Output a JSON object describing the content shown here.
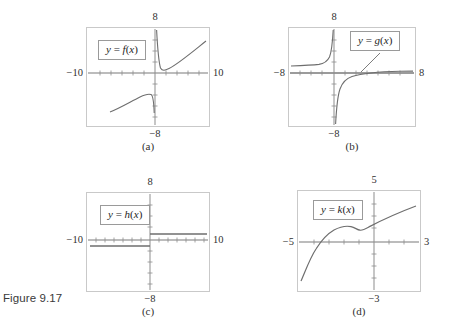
{
  "figure": {
    "caption": "Figure 9.17",
    "background": "#ffffff",
    "frame_color": "#c9c9c9",
    "curve_color": "#6e6e6e",
    "axis_color": "#7a7a7a"
  },
  "panels": [
    {
      "id": "a",
      "subcaption": "(a)",
      "label": "y = f(x)",
      "label_var": "f",
      "axis_labels": {
        "top": "8",
        "bottom": "−8",
        "left": "−10",
        "right": "10"
      },
      "xlim": [
        -10,
        10
      ],
      "ylim": [
        -8,
        8
      ]
    },
    {
      "id": "b",
      "subcaption": "(b)",
      "label": "y = g(x)",
      "label_var": "g",
      "axis_labels": {
        "top": "8",
        "bottom": "−8",
        "left": "−8",
        "right": "8"
      },
      "xlim": [
        -8,
        8
      ],
      "ylim": [
        -8,
        8
      ]
    },
    {
      "id": "c",
      "subcaption": "(c)",
      "label": "y = h(x)",
      "label_var": "h",
      "axis_labels": {
        "top": "8",
        "bottom": "−8",
        "left": "−10",
        "right": "10"
      },
      "xlim": [
        -10,
        10
      ],
      "ylim": [
        -8,
        8
      ]
    },
    {
      "id": "d",
      "subcaption": "(d)",
      "label": "y = k(x)",
      "label_var": "k",
      "axis_labels": {
        "top": "5",
        "bottom": "−3",
        "left": "−5",
        "right": "3"
      },
      "xlim": [
        -5,
        3
      ],
      "ylim": [
        -3,
        5
      ]
    }
  ],
  "chart_data": [
    {
      "type": "line",
      "title": "y = f(x)",
      "xlabel": "",
      "ylabel": "",
      "xlim": [
        -10,
        10
      ],
      "ylim": [
        -8,
        8
      ],
      "grid": false,
      "legend": "none",
      "axis_tick_labels": {
        "top": "8",
        "bottom": "-8",
        "left": "-10",
        "right": "10"
      },
      "vertical_asymptote": 0,
      "series": [
        {
          "name": "f-left-branch",
          "comment": "lower-left arc: rises from lower left, peaks, then plunges to -infinity at x=0-",
          "x": [
            -7.4,
            -6.6,
            -5.8,
            -5.0,
            -4.2,
            -3.4,
            -2.8,
            -2.2,
            -1.7,
            -1.3,
            -1.0,
            -0.8,
            -0.7,
            -0.65,
            -0.6,
            -0.55
          ],
          "y": [
            -6.2,
            -5.8,
            -5.4,
            -5.0,
            -4.6,
            -4.2,
            -3.9,
            -3.6,
            -3.4,
            -3.3,
            -3.3,
            -3.45,
            -3.8,
            -4.3,
            -5.2,
            -6.3
          ]
        },
        {
          "name": "f-right-branch",
          "comment": "descends steeply from +8 near x=0+, minimum just above axis, then rises to upper right",
          "x": [
            0.12,
            0.16,
            0.2,
            0.28,
            0.4,
            0.6,
            0.9,
            1.4,
            2.2,
            3.2,
            4.4,
            5.8,
            7.2,
            8.6,
            9.8
          ],
          "y": [
            8.0,
            6.4,
            4.6,
            2.6,
            1.3,
            0.6,
            0.35,
            0.55,
            1.2,
            2.1,
            3.1,
            4.2,
            5.3,
            6.3,
            7.2
          ]
        }
      ]
    },
    {
      "type": "line",
      "title": "y = g(x)",
      "xlabel": "",
      "ylabel": "",
      "xlim": [
        -8,
        8
      ],
      "ylim": [
        -8,
        8
      ],
      "grid": false,
      "legend": "none",
      "axis_tick_labels": {
        "top": "8",
        "bottom": "-8",
        "left": "-8",
        "right": "8"
      },
      "vertical_asymptote": 0,
      "series": [
        {
          "name": "g-left-branch",
          "comment": "nearly flat slightly above axis from left, then sweeps up to +infinity at x=0-",
          "x": [
            -7.9,
            -7.0,
            -6.0,
            -5.0,
            -4.0,
            -3.2,
            -2.6,
            -2.0,
            -1.6,
            -1.2,
            -0.9,
            -0.65,
            -0.45,
            -0.3,
            -0.2,
            -0.12
          ],
          "y": [
            0.55,
            0.6,
            0.62,
            0.66,
            0.72,
            0.8,
            0.92,
            1.15,
            1.45,
            2.0,
            2.8,
            3.9,
            5.2,
            6.5,
            7.4,
            8.0
          ]
        },
        {
          "name": "g-right-branch",
          "comment": "comes up from -infinity at x=0+, crosses below axis then flattens slightly above axis to the right",
          "x": [
            0.16,
            0.22,
            0.3,
            0.42,
            0.6,
            0.85,
            1.2,
            1.7,
            2.4,
            3.3,
            4.3,
            5.4,
            6.5,
            7.6,
            7.95
          ],
          "y": [
            -8.0,
            -6.6,
            -5.2,
            -3.9,
            -2.8,
            -1.9,
            -1.2,
            -0.7,
            -0.35,
            -0.1,
            0.05,
            0.15,
            0.22,
            0.28,
            0.3
          ]
        }
      ]
    },
    {
      "type": "line",
      "title": "y = h(x)",
      "xlabel": "",
      "ylabel": "",
      "xlim": [
        -10,
        10
      ],
      "ylim": [
        -8,
        8
      ],
      "grid": false,
      "legend": "none",
      "axis_tick_labels": {
        "top": "8",
        "bottom": "-8",
        "left": "-10",
        "right": "10"
      },
      "jump_discontinuity_at": 0,
      "series": [
        {
          "name": "h-left-segment",
          "comment": "constant value just below the x-axis for x < 0",
          "x": [
            -9.9,
            0
          ],
          "y": [
            -0.75,
            -0.75
          ]
        },
        {
          "name": "h-right-segment",
          "comment": "constant value just above the x-axis for x > 0",
          "x": [
            0,
            9.9
          ],
          "y": [
            0.75,
            0.75
          ]
        }
      ]
    },
    {
      "type": "line",
      "title": "y = k(x)",
      "xlabel": "",
      "ylabel": "",
      "xlim": [
        -5,
        3
      ],
      "ylim": [
        -3,
        5
      ],
      "grid": false,
      "legend": "none",
      "axis_tick_labels": {
        "top": "5",
        "bottom": "-3",
        "left": "-5",
        "right": "3"
      },
      "series": [
        {
          "name": "k",
          "comment": "rises steeply from lower left, crosses axis, local max, small dip, then rises steadily",
          "x": [
            -4.75,
            -4.5,
            -4.2,
            -3.9,
            -3.6,
            -3.3,
            -3.0,
            -2.7,
            -2.4,
            -2.1,
            -1.8,
            -1.5,
            -1.2,
            -0.9,
            -0.6,
            -0.3,
            0.0,
            0.4,
            0.9,
            1.4,
            1.9,
            2.4,
            2.85
          ],
          "y": [
            -2.55,
            -2.0,
            -1.3,
            -0.7,
            -0.15,
            0.35,
            0.8,
            1.15,
            1.42,
            1.6,
            1.7,
            1.72,
            1.68,
            1.55,
            1.62,
            1.82,
            2.0,
            2.2,
            2.45,
            2.68,
            2.9,
            3.1,
            3.28
          ]
        }
      ]
    }
  ]
}
